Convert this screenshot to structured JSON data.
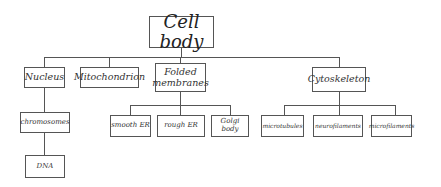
{
  "diagram": {
    "type": "hierarchy",
    "root": {
      "label": "Cell body"
    },
    "level1": [
      {
        "label": "Nucleus"
      },
      {
        "label": "Mitochondrion"
      },
      {
        "label": "Folded membranes"
      },
      {
        "label": "Cytoskeleton"
      }
    ],
    "nucleus_children": [
      {
        "label": "chromosomes"
      }
    ],
    "chromosome_children": [
      {
        "label": "DNA"
      }
    ],
    "folded_children": [
      {
        "label": "smooth ER"
      },
      {
        "label": "rough ER"
      },
      {
        "label": "Golgi body"
      }
    ],
    "cytoskeleton_children": [
      {
        "label": "microtubules"
      },
      {
        "label": "neurofilaments"
      },
      {
        "label": "microfilaments"
      }
    ],
    "colors": {
      "line": "#555555",
      "text": "#333333",
      "background": "#ffffff"
    }
  }
}
